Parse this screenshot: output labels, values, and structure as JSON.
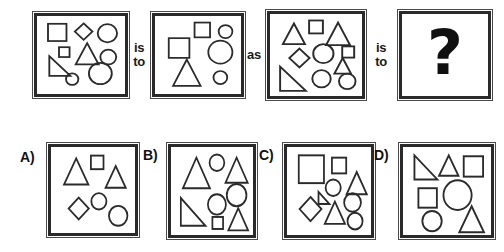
{
  "puzzle": {
    "type": "visual-analogy",
    "connector_1": "is\nto",
    "connector_2": "as",
    "connector_3": "is\nto",
    "answer_placeholder": "?"
  },
  "stroke_color": "#2b2b2b",
  "frame_color": "#2a2a2a",
  "background_color": "#ffffff",
  "stimulus_panels": [
    {
      "id": "panel-1",
      "name": "analogy-panel-a",
      "shape_count": 9,
      "shapes": [
        {
          "kind": "square",
          "cx": 23,
          "cy": 20,
          "size": 21
        },
        {
          "kind": "diamond",
          "cx": 53,
          "cy": 19,
          "size": 20
        },
        {
          "kind": "circle",
          "cx": 80,
          "cy": 21,
          "r": 11
        },
        {
          "kind": "square",
          "cx": 31,
          "cy": 44,
          "size": 12
        },
        {
          "kind": "triangle",
          "cx": 57,
          "cy": 46,
          "size": 26
        },
        {
          "kind": "right-triangle",
          "cx": 26,
          "cy": 61,
          "size": 24
        },
        {
          "kind": "circle",
          "cx": 81,
          "cy": 50,
          "r": 9
        },
        {
          "kind": "circle",
          "cx": 72,
          "cy": 70,
          "r": 13
        },
        {
          "kind": "circle",
          "cx": 40,
          "cy": 77,
          "r": 7
        }
      ]
    },
    {
      "id": "panel-2",
      "name": "analogy-panel-b",
      "shape_count": 6,
      "shapes": [
        {
          "kind": "square",
          "cx": 55,
          "cy": 17,
          "size": 18
        },
        {
          "kind": "circle",
          "cx": 82,
          "cy": 19,
          "r": 8
        },
        {
          "kind": "square",
          "cx": 28,
          "cy": 39,
          "size": 24
        },
        {
          "kind": "circle",
          "cx": 76,
          "cy": 44,
          "r": 14
        },
        {
          "kind": "triangle",
          "cx": 37,
          "cy": 69,
          "size": 32
        },
        {
          "kind": "circle",
          "cx": 76,
          "cy": 75,
          "r": 8
        }
      ]
    },
    {
      "id": "panel-3",
      "name": "analogy-panel-c",
      "shape_count": 11,
      "shapes": [
        {
          "kind": "triangle",
          "cx": 26,
          "cy": 23,
          "size": 24
        },
        {
          "kind": "square",
          "cx": 50,
          "cy": 15,
          "size": 15
        },
        {
          "kind": "triangle",
          "cx": 74,
          "cy": 23,
          "size": 26
        },
        {
          "kind": "diamond",
          "cx": 32,
          "cy": 51,
          "size": 22
        },
        {
          "kind": "circle",
          "cx": 58,
          "cy": 46,
          "r": 11
        },
        {
          "kind": "square",
          "cx": 85,
          "cy": 44,
          "size": 13
        },
        {
          "kind": "triangle",
          "cx": 79,
          "cy": 60,
          "size": 18
        },
        {
          "kind": "right-triangle",
          "cx": 25,
          "cy": 75,
          "size": 28
        },
        {
          "kind": "circle",
          "cx": 56,
          "cy": 75,
          "r": 10
        },
        {
          "kind": "circle",
          "cx": 84,
          "cy": 78,
          "r": 9
        }
      ]
    },
    {
      "id": "panel-4",
      "name": "analogy-answer-panel",
      "shape_count": 0,
      "shapes": []
    }
  ],
  "options": [
    {
      "id": "option-a",
      "label": "A)",
      "name": "answer-option-a",
      "shape_count": 6,
      "shapes": [
        {
          "kind": "triangle",
          "cx": 30,
          "cy": 27,
          "size": 29
        },
        {
          "kind": "square",
          "cx": 55,
          "cy": 17,
          "size": 15
        },
        {
          "kind": "triangle",
          "cx": 77,
          "cy": 33,
          "size": 24
        },
        {
          "kind": "diamond",
          "cx": 33,
          "cy": 68,
          "size": 24
        },
        {
          "kind": "circle",
          "cx": 57,
          "cy": 60,
          "r": 9
        },
        {
          "kind": "circle",
          "cx": 80,
          "cy": 76,
          "r": 11
        }
      ]
    },
    {
      "id": "option-b",
      "label": "B)",
      "name": "answer-option-b",
      "shape_count": 8,
      "shapes": [
        {
          "kind": "triangle",
          "cx": 31,
          "cy": 28,
          "size": 33
        },
        {
          "kind": "circle",
          "cx": 56,
          "cy": 17,
          "r": 9
        },
        {
          "kind": "triangle",
          "cx": 80,
          "cy": 25,
          "size": 27
        },
        {
          "kind": "circle",
          "cx": 80,
          "cy": 52,
          "r": 12
        },
        {
          "kind": "right-triangle",
          "cx": 27,
          "cy": 70,
          "size": 30
        },
        {
          "kind": "circle",
          "cx": 56,
          "cy": 62,
          "r": 11
        },
        {
          "kind": "square",
          "cx": 57,
          "cy": 82,
          "size": 13
        },
        {
          "kind": "triangle",
          "cx": 82,
          "cy": 78,
          "size": 24
        }
      ]
    },
    {
      "id": "option-c",
      "label": "C)",
      "name": "answer-option-c",
      "shape_count": 9,
      "shapes": [
        {
          "kind": "square",
          "cx": 29,
          "cy": 24,
          "size": 30
        },
        {
          "kind": "square",
          "cx": 62,
          "cy": 20,
          "size": 17
        },
        {
          "kind": "triangle",
          "cx": 83,
          "cy": 39,
          "size": 24
        },
        {
          "kind": "circle",
          "cx": 55,
          "cy": 44,
          "r": 9
        },
        {
          "kind": "right-triangle",
          "cx": 44,
          "cy": 55,
          "size": 13
        },
        {
          "kind": "diamond",
          "cx": 28,
          "cy": 67,
          "size": 26
        },
        {
          "kind": "circle",
          "cx": 78,
          "cy": 60,
          "r": 10
        },
        {
          "kind": "triangle",
          "cx": 57,
          "cy": 71,
          "size": 24
        },
        {
          "kind": "circle",
          "cx": 81,
          "cy": 80,
          "r": 9
        }
      ]
    },
    {
      "id": "option-d",
      "label": "D)",
      "name": "answer-option-d",
      "shape_count": 7,
      "shapes": [
        {
          "kind": "right-triangle",
          "cx": 26,
          "cy": 22,
          "size": 26
        },
        {
          "kind": "triangle",
          "cx": 52,
          "cy": 20,
          "size": 22
        },
        {
          "kind": "square",
          "cx": 80,
          "cy": 21,
          "size": 22
        },
        {
          "kind": "square",
          "cx": 28,
          "cy": 55,
          "size": 21
        },
        {
          "kind": "circle",
          "cx": 62,
          "cy": 52,
          "r": 16
        },
        {
          "kind": "circle",
          "cx": 33,
          "cy": 80,
          "r": 11
        },
        {
          "kind": "triangle",
          "cx": 78,
          "cy": 78,
          "size": 28
        }
      ]
    }
  ]
}
